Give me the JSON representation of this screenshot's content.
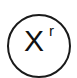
{
  "button": {
    "base_label": "X",
    "superscript_label": "r",
    "icon": "power-x-to-r-icon",
    "stroke_color": "#1a1a1a",
    "background_color": "#ffffff"
  }
}
